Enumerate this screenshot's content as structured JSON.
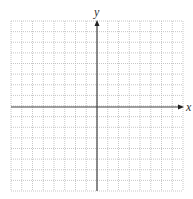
{
  "diagram": {
    "type": "coordinate-grid",
    "x_axis_label": "x",
    "y_axis_label": "y",
    "grid": {
      "columns": 16,
      "rows": 16,
      "left": 11,
      "top": 21,
      "right": 183,
      "bottom": 191
    },
    "origin": {
      "x": 97,
      "y": 107
    },
    "colors": {
      "grid_line": "#b8b8b8",
      "axis": "#444444",
      "background": "#ffffff"
    }
  }
}
